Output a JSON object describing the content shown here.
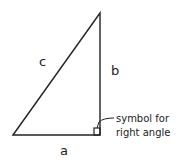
{
  "diagram": {
    "type": "right-triangle",
    "labels": {
      "hypotenuse": "c",
      "vertical_side": "b",
      "base": "a"
    },
    "annotation": {
      "line1": "symbol for",
      "line2": "right angle"
    },
    "stroke_color": "#222222"
  }
}
